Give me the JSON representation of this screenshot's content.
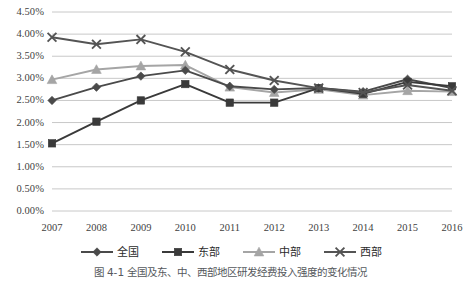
{
  "caption": "图 4-1  全国及东、中、西部地区研发经费投入强度的变化情况",
  "axes": {
    "y_ticks": [
      "0.00%",
      "0.50%",
      "1.00%",
      "1.50%",
      "2.00%",
      "2.50%",
      "3.00%",
      "3.50%",
      "4.00%",
      "4.50%"
    ],
    "x_ticks": [
      "2007",
      "2008",
      "2009",
      "2010",
      "2011",
      "2012",
      "2013",
      "2014",
      "2015",
      "2016"
    ]
  },
  "legend": {
    "position": "bottom",
    "entries": [
      {
        "label": "全国",
        "marker": "diamond",
        "color": "#4a4a4a"
      },
      {
        "label": "东部",
        "marker": "square",
        "color": "#3a3a3a"
      },
      {
        "label": "中部",
        "marker": "triangle",
        "color": "#a5a5a5"
      },
      {
        "label": "西部",
        "marker": "x",
        "color": "#545454"
      }
    ]
  },
  "chart_data": {
    "type": "line",
    "title": "",
    "xlabel": "",
    "ylabel": "",
    "ylim": [
      0,
      4.5
    ],
    "ytick_step": 0.5,
    "yunit": "%",
    "grid": true,
    "legend_position": "bottom",
    "categories": [
      "2007",
      "2008",
      "2009",
      "2010",
      "2011",
      "2012",
      "2013",
      "2014",
      "2015",
      "2016"
    ],
    "series": [
      {
        "name": "全国",
        "marker": "diamond",
        "color": "#4a4a4a",
        "values": [
          2.5,
          2.8,
          3.05,
          3.18,
          2.82,
          2.75,
          2.78,
          2.7,
          2.98,
          2.78
        ]
      },
      {
        "name": "东部",
        "marker": "square",
        "color": "#3a3a3a",
        "values": [
          1.53,
          2.02,
          2.5,
          2.87,
          2.45,
          2.45,
          2.78,
          2.65,
          2.92,
          2.82
        ]
      },
      {
        "name": "中部",
        "marker": "triangle",
        "color": "#a5a5a5",
        "values": [
          2.97,
          3.2,
          3.28,
          3.3,
          2.8,
          2.68,
          2.75,
          2.62,
          2.72,
          2.7
        ]
      },
      {
        "name": "西部",
        "marker": "x",
        "color": "#545454",
        "values": [
          3.93,
          3.77,
          3.88,
          3.6,
          3.2,
          2.95,
          2.78,
          2.68,
          2.85,
          2.72
        ]
      }
    ]
  }
}
